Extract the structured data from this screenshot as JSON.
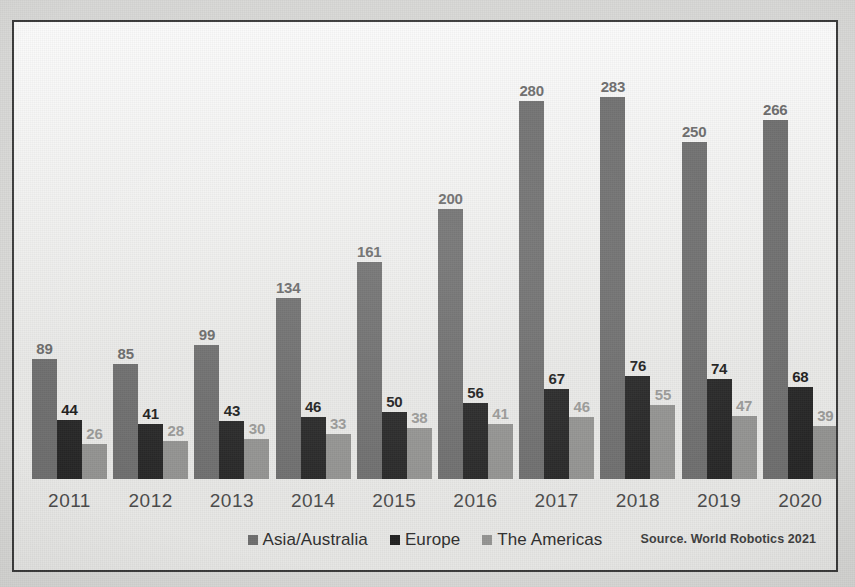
{
  "chart_data": {
    "type": "bar",
    "title": "",
    "xlabel": "",
    "ylabel": "",
    "grid": false,
    "legend_position": "bottom-center",
    "ylim": [
      0,
      300
    ],
    "categories": [
      "2011",
      "2012",
      "2013",
      "2014",
      "2015",
      "2016",
      "2017",
      "2018",
      "2019",
      "2020"
    ],
    "series": [
      {
        "name": "Asia/Australia",
        "color": "#6e6e6e",
        "values": [
          89,
          85,
          99,
          134,
          161,
          200,
          280,
          283,
          250,
          266
        ]
      },
      {
        "name": "Europe",
        "color": "#262626",
        "values": [
          44,
          41,
          43,
          46,
          50,
          56,
          67,
          76,
          74,
          68
        ]
      },
      {
        "name": "The Americas",
        "color": "#939391",
        "values": [
          26,
          28,
          30,
          33,
          38,
          41,
          46,
          55,
          47,
          39
        ]
      }
    ]
  },
  "legend": {
    "items": [
      {
        "label": "Asia/Australia"
      },
      {
        "label": "Europe"
      },
      {
        "label": "The Americas"
      }
    ]
  },
  "source": {
    "text": "Source. World Robotics 2021"
  }
}
